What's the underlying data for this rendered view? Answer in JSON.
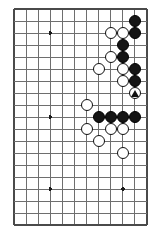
{
  "diagram": {
    "kind": "go-board-diagram",
    "board": {
      "columns": 12,
      "rows": 19,
      "left": 14,
      "top": 9,
      "right": 147,
      "bottom": 225,
      "col_spacing": 12.09,
      "row_spacing": 12.0,
      "line_color": "#6e6e6e",
      "border_color": "#4a4a4a",
      "background_color": "#ffffff",
      "line_width": 1,
      "border_width": 1.6,
      "edges_drawn": [
        "top",
        "left",
        "bottom",
        "right"
      ]
    },
    "star_points": [
      {
        "col": 3,
        "row": 2
      },
      {
        "col": 3,
        "row": 9
      },
      {
        "col": 3,
        "row": 15
      },
      {
        "col": 9,
        "row": 15
      }
    ],
    "star_radius": 1.9,
    "stone_radius": 6.0,
    "stones": [
      {
        "color": "black",
        "col": 10,
        "row": 1,
        "label": ""
      },
      {
        "color": "black",
        "col": 10,
        "row": 2,
        "label": ""
      },
      {
        "color": "white",
        "col": 8,
        "row": 2,
        "label": ""
      },
      {
        "color": "white",
        "col": 9,
        "row": 2,
        "label": ""
      },
      {
        "color": "black",
        "col": 9,
        "row": 3,
        "label": ""
      },
      {
        "color": "white",
        "col": 8,
        "row": 4,
        "label": ""
      },
      {
        "color": "black",
        "col": 9,
        "row": 4,
        "label": ""
      },
      {
        "color": "white",
        "col": 7,
        "row": 5,
        "label": ""
      },
      {
        "color": "white",
        "col": 9,
        "row": 5,
        "label": ""
      },
      {
        "color": "black",
        "col": 10,
        "row": 5,
        "label": ""
      },
      {
        "color": "white",
        "col": 9,
        "row": 6,
        "label": ""
      },
      {
        "color": "black",
        "col": 10,
        "row": 6,
        "label": ""
      },
      {
        "color": "white",
        "col": 10,
        "row": 7,
        "label": "triangle"
      },
      {
        "color": "white",
        "col": 6,
        "row": 8,
        "label": ""
      },
      {
        "color": "black",
        "col": 7,
        "row": 9,
        "label": ""
      },
      {
        "color": "black",
        "col": 8,
        "row": 9,
        "label": ""
      },
      {
        "color": "black",
        "col": 9,
        "row": 9,
        "label": ""
      },
      {
        "color": "black",
        "col": 10,
        "row": 9,
        "label": ""
      },
      {
        "color": "white",
        "col": 6,
        "row": 10,
        "label": ""
      },
      {
        "color": "white",
        "col": 8,
        "row": 10,
        "label": ""
      },
      {
        "color": "white",
        "col": 9,
        "row": 10,
        "label": ""
      },
      {
        "color": "white",
        "col": 7,
        "row": 11,
        "label": ""
      },
      {
        "color": "white",
        "col": 9,
        "row": 12,
        "label": ""
      }
    ],
    "counts": {
      "black_stones": 10,
      "white_stones": 13,
      "marked_stones": 1
    }
  }
}
